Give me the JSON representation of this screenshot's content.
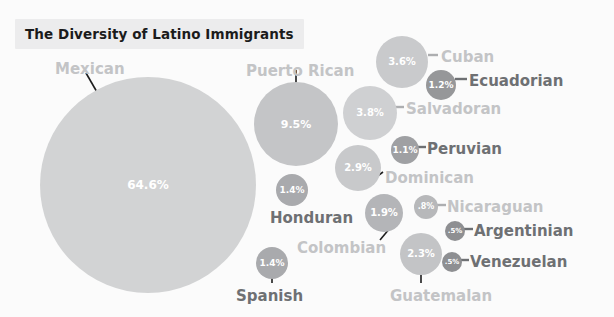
{
  "title": "The Diversity of Latino Immigrants",
  "chart_data": {
    "type": "bubble",
    "title": "The Diversity of Latino Immigrants",
    "xlabel": "",
    "ylabel": "",
    "legend": "none",
    "grid": false,
    "unit": "percent",
    "categories": [
      "Mexican",
      "Puerto Rican",
      "Salvadoran",
      "Cuban",
      "Dominican",
      "Guatemalan",
      "Colombian",
      "Honduran",
      "Spanish",
      "Ecuadorian",
      "Peruvian",
      "Nicaraguan",
      "Argentinian",
      "Venezuelan"
    ],
    "values": [
      64.6,
      9.5,
      3.8,
      3.6,
      2.9,
      2.3,
      1.9,
      1.4,
      1.4,
      1.2,
      1.1,
      0.8,
      0.5,
      0.5
    ],
    "value_labels": [
      "64.6%",
      "9.5%",
      "3.8%",
      "3.6%",
      "2.9%",
      "2.3%",
      "1.9%",
      "1.4%",
      "1.4%",
      "1.2%",
      "1.1%",
      ".8%",
      ".5%",
      ".5%"
    ],
    "bubbles": [
      {
        "name": "Mexican",
        "value": 64.6,
        "label": "64.6%",
        "cx": 148,
        "cy": 185,
        "r": 108,
        "fill": "#d2d3d4",
        "pct_size": 12,
        "pct_color": "#ffffff"
      },
      {
        "name": "Puerto Rican",
        "value": 9.5,
        "label": "9.5%",
        "cx": 296,
        "cy": 124,
        "r": 42,
        "fill": "#c4c5c7",
        "pct_size": 11,
        "pct_color": "#ffffff"
      },
      {
        "name": "Salvadoran",
        "value": 3.8,
        "label": "3.8%",
        "cx": 370,
        "cy": 113,
        "r": 27,
        "fill": "#cfd0d2",
        "pct_size": 10,
        "pct_color": "#ffffff"
      },
      {
        "name": "Cuban",
        "value": 3.6,
        "label": "3.6%",
        "cx": 402,
        "cy": 62,
        "r": 26,
        "fill": "#c9cacc",
        "pct_size": 10,
        "pct_color": "#ffffff"
      },
      {
        "name": "Dominican",
        "value": 2.9,
        "label": "2.9%",
        "cx": 358,
        "cy": 168,
        "r": 23,
        "fill": "#c8c9cb",
        "pct_size": 10,
        "pct_color": "#ffffff"
      },
      {
        "name": "Guatemalan",
        "value": 2.3,
        "label": "2.3%",
        "cx": 421,
        "cy": 254,
        "r": 21,
        "fill": "#c3c4c6",
        "pct_size": 10,
        "pct_color": "#ffffff"
      },
      {
        "name": "Colombian",
        "value": 1.9,
        "label": "1.9%",
        "cx": 384,
        "cy": 213,
        "r": 19,
        "fill": "#b4b5b8",
        "pct_size": 10,
        "pct_color": "#ffffff"
      },
      {
        "name": "Honduran",
        "value": 1.4,
        "label": "1.4%",
        "cx": 292,
        "cy": 190,
        "r": 16,
        "fill": "#a9aaad",
        "pct_size": 9,
        "pct_color": "#ffffff"
      },
      {
        "name": "Spanish",
        "value": 1.4,
        "label": "1.4%",
        "cx": 272,
        "cy": 263,
        "r": 16,
        "fill": "#a9aaad",
        "pct_size": 9,
        "pct_color": "#ffffff"
      },
      {
        "name": "Ecuadorian",
        "value": 1.2,
        "label": "1.2%",
        "cx": 441,
        "cy": 85,
        "r": 15,
        "fill": "#969799",
        "pct_size": 9,
        "pct_color": "#ffffff"
      },
      {
        "name": "Peruvian",
        "value": 1.1,
        "label": "1.1%",
        "cx": 405,
        "cy": 150,
        "r": 14,
        "fill": "#9fa0a3",
        "pct_size": 9,
        "pct_color": "#ffffff"
      },
      {
        "name": "Nicaraguan",
        "value": 0.8,
        "label": ".8%",
        "cx": 426,
        "cy": 207,
        "r": 12,
        "fill": "#b7b8ba",
        "pct_size": 8,
        "pct_color": "#ffffff"
      },
      {
        "name": "Argentinian",
        "value": 0.5,
        "label": ".5%",
        "cx": 455,
        "cy": 231,
        "r": 10,
        "fill": "#8e8f92",
        "pct_size": 7,
        "pct_color": "#ffffff"
      },
      {
        "name": "Venezuelan",
        "value": 0.5,
        "label": ".5%",
        "cx": 452,
        "cy": 262,
        "r": 10,
        "fill": "#8e8f92",
        "pct_size": 7,
        "pct_color": "#ffffff"
      }
    ],
    "annotations": [
      {
        "name": "Mexican",
        "text": "Mexican",
        "x": 55,
        "y": 62,
        "tone": "light",
        "size": 15
      },
      {
        "name": "Puerto Rican",
        "text": "Puerto Rican",
        "x": 246,
        "y": 64,
        "tone": "light",
        "size": 15
      },
      {
        "name": "Cuban",
        "text": "Cuban",
        "x": 441,
        "y": 50,
        "tone": "light",
        "size": 15
      },
      {
        "name": "Ecuadorian",
        "text": "Ecuadorian",
        "x": 469,
        "y": 74,
        "tone": "dark",
        "size": 15
      },
      {
        "name": "Salvadoran",
        "text": "Salvadoran",
        "x": 406,
        "y": 102,
        "tone": "light",
        "size": 15
      },
      {
        "name": "Peruvian",
        "text": "Peruvian",
        "x": 427,
        "y": 142,
        "tone": "dark",
        "size": 15
      },
      {
        "name": "Dominican",
        "text": "Dominican",
        "x": 385,
        "y": 171,
        "tone": "light",
        "size": 15
      },
      {
        "name": "Nicaraguan",
        "text": "Nicaraguan",
        "x": 447,
        "y": 200,
        "tone": "light",
        "size": 15
      },
      {
        "name": "Honduran",
        "text": "Honduran",
        "x": 270,
        "y": 211,
        "tone": "dark",
        "size": 15
      },
      {
        "name": "Argentinian",
        "text": "Argentinian",
        "x": 474,
        "y": 224,
        "tone": "dark",
        "size": 15
      },
      {
        "name": "Colombian",
        "text": "Colombian",
        "x": 297,
        "y": 241,
        "tone": "light",
        "size": 15
      },
      {
        "name": "Venezuelan",
        "text": "Venezuelan",
        "x": 470,
        "y": 255,
        "tone": "dark",
        "size": 15
      },
      {
        "name": "Spanish",
        "text": "Spanish",
        "x": 236,
        "y": 289,
        "tone": "dark",
        "size": 15
      },
      {
        "name": "Guatemalan",
        "text": "Guatemalan",
        "x": 390,
        "y": 289,
        "tone": "light",
        "size": 15
      }
    ]
  }
}
